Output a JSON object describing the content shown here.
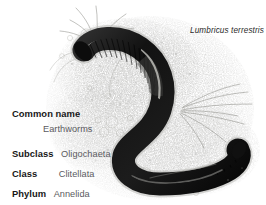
{
  "figure": {
    "alt_name": "earthworm-illustration",
    "scientific_name": "Lumbricus terrestris"
  },
  "taxonomy": {
    "rows": [
      {
        "label": "Common name",
        "value": "Earthworms",
        "layout": "stacked"
      },
      {
        "label": "Subclass",
        "value": "Oligochaeta",
        "layout": "inline"
      },
      {
        "label": "Class",
        "value": "Clitellata",
        "layout": "inline-wide"
      },
      {
        "label": "Phylum",
        "value": "Annelida",
        "layout": "inline"
      }
    ]
  },
  "colors": {
    "background": "#ffffff",
    "label_text": "#171717",
    "value_text": "#5a5a60",
    "sci_name_text": "#2b2b2b",
    "worm_dark": "#141414",
    "worm_mid": "#3a3a3a",
    "worm_highlight": "#d8d8d4",
    "soil_stipple": "#9a9a96",
    "grass_line": "#8d8d88"
  }
}
